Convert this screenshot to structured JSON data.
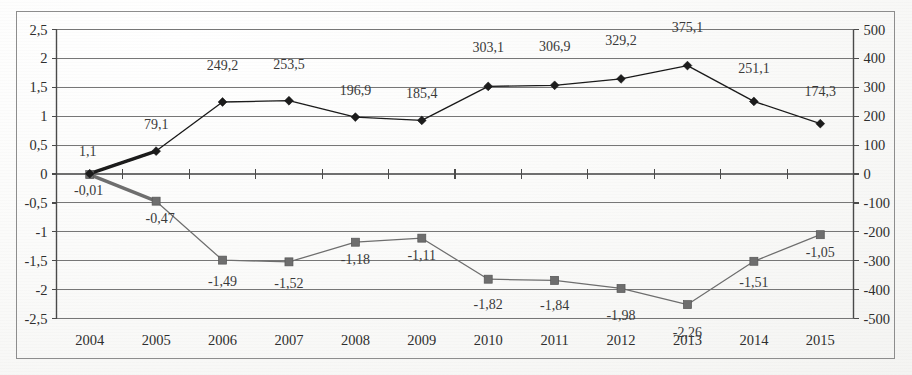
{
  "figure": {
    "background_color": "#f7f7f5",
    "frame_color": "#8d8d8d",
    "grid_color": "#6f6f6f",
    "series1_color": "#1a1a1a",
    "series2_color": "#6e6e6e"
  },
  "chart_data": {
    "type": "line",
    "title": "",
    "xlabel": "",
    "ylabel": "",
    "grid": true,
    "legend": "none",
    "decimal_separator": ",",
    "categories": [
      "2004",
      "2005",
      "2006",
      "2007",
      "2008",
      "2009",
      "2010",
      "2011",
      "2012",
      "2013",
      "2014",
      "2015"
    ],
    "axes": {
      "left": {
        "ylim": [
          -2.5,
          2.5
        ],
        "step": 0.5,
        "ticks": [
          "2,5",
          "2",
          "1,5",
          "1",
          "0,5",
          "0",
          "-0,5",
          "-1",
          "-1,5",
          "-2",
          "-2,5"
        ],
        "tick_values": [
          2.5,
          2,
          1.5,
          1,
          0.5,
          0,
          -0.5,
          -1,
          -1.5,
          -2,
          -2.5
        ]
      },
      "right": {
        "ylim": [
          -500,
          500
        ],
        "step": 100,
        "ticks": [
          "500",
          "400",
          "300",
          "200",
          "100",
          "0",
          "-100",
          "-200",
          "-300",
          "-400",
          "-500"
        ],
        "tick_values": [
          500,
          400,
          300,
          200,
          100,
          0,
          -100,
          -200,
          -300,
          -400,
          -500
        ]
      }
    },
    "series": [
      {
        "name": "series-diamond",
        "axis": "right",
        "marker": "diamond",
        "color": "#1a1a1a",
        "values": [
          1.1,
          79.1,
          249.2,
          253.5,
          196.9,
          185.4,
          303.1,
          306.9,
          329.2,
          375.1,
          251.1,
          174.3
        ],
        "labels": [
          "1,1",
          "79,1",
          "249,2",
          "253,5",
          "196,9",
          "185,4",
          "303,1",
          "306,9",
          "329,2",
          "375,1",
          "251,1",
          "174,3"
        ]
      },
      {
        "name": "series-square",
        "axis": "left",
        "marker": "square",
        "color": "#6e6e6e",
        "values": [
          -0.01,
          -0.47,
          -1.49,
          -1.52,
          -1.18,
          -1.11,
          -1.82,
          -1.84,
          -1.98,
          -2.26,
          -1.51,
          -1.05
        ],
        "labels": [
          "-0,01",
          "-0,47",
          "-1,49",
          "-1,52",
          "-1,18",
          "-1,11",
          "-1,82",
          "-1,84",
          "-1,98",
          "-2,26",
          "-1,51",
          "-1,05"
        ]
      }
    ],
    "label_offsets": {
      "series1": [
        {
          "dx": -2,
          "dy": -18
        },
        {
          "dx": 0,
          "dy": -22
        },
        {
          "dx": 0,
          "dy": -32
        },
        {
          "dx": 0,
          "dy": -32
        },
        {
          "dx": 0,
          "dy": -22
        },
        {
          "dx": 0,
          "dy": -22
        },
        {
          "dx": 0,
          "dy": -34
        },
        {
          "dx": 0,
          "dy": -34
        },
        {
          "dx": 0,
          "dy": -34
        },
        {
          "dx": 0,
          "dy": -34
        },
        {
          "dx": 0,
          "dy": -28
        },
        {
          "dx": 0,
          "dy": -28
        }
      ],
      "series2": [
        {
          "dx": -1,
          "dy": 20
        },
        {
          "dx": 4,
          "dy": 22
        },
        {
          "dx": 0,
          "dy": 26
        },
        {
          "dx": 0,
          "dy": 26
        },
        {
          "dx": 0,
          "dy": 22
        },
        {
          "dx": 0,
          "dy": 22
        },
        {
          "dx": 0,
          "dy": 30
        },
        {
          "dx": 0,
          "dy": 30
        },
        {
          "dx": 0,
          "dy": 32
        },
        {
          "dx": 0,
          "dy": 32
        },
        {
          "dx": 0,
          "dy": 26
        },
        {
          "dx": 0,
          "dy": 22
        }
      ]
    }
  }
}
